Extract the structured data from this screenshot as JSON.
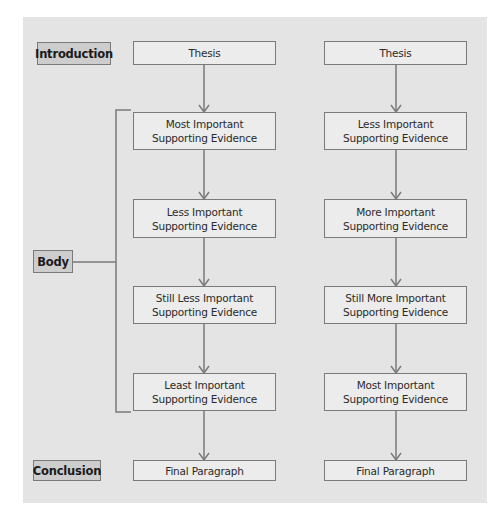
{
  "labels": {
    "introduction": "Introduction",
    "body": "Body",
    "conclusion": "Conclusion"
  },
  "left_column": {
    "thesis": "Thesis",
    "evidence": [
      {
        "line1": "Most Important",
        "line2": "Supporting Evidence"
      },
      {
        "line1": "Less Important",
        "line2": "Supporting Evidence"
      },
      {
        "line1": "Still Less Important",
        "line2": "Supporting Evidence"
      },
      {
        "line1": "Least Important",
        "line2": "Supporting Evidence"
      }
    ],
    "final": "Final Paragraph"
  },
  "right_column": {
    "thesis": "Thesis",
    "evidence": [
      {
        "line1": "Less Important",
        "line2": "Supporting Evidence"
      },
      {
        "line1": "More Important",
        "line2": "Supporting Evidence"
      },
      {
        "line1": "Still More Important",
        "line2": "Supporting Evidence"
      },
      {
        "line1": "Most Important",
        "line2": "Supporting Evidence"
      }
    ],
    "final": "Final Paragraph"
  },
  "colors": {
    "panel": "#e4e4e4",
    "node_fill": "#ececec",
    "label_fill": "#cdcdcd",
    "stroke": "#7a7a7a"
  }
}
